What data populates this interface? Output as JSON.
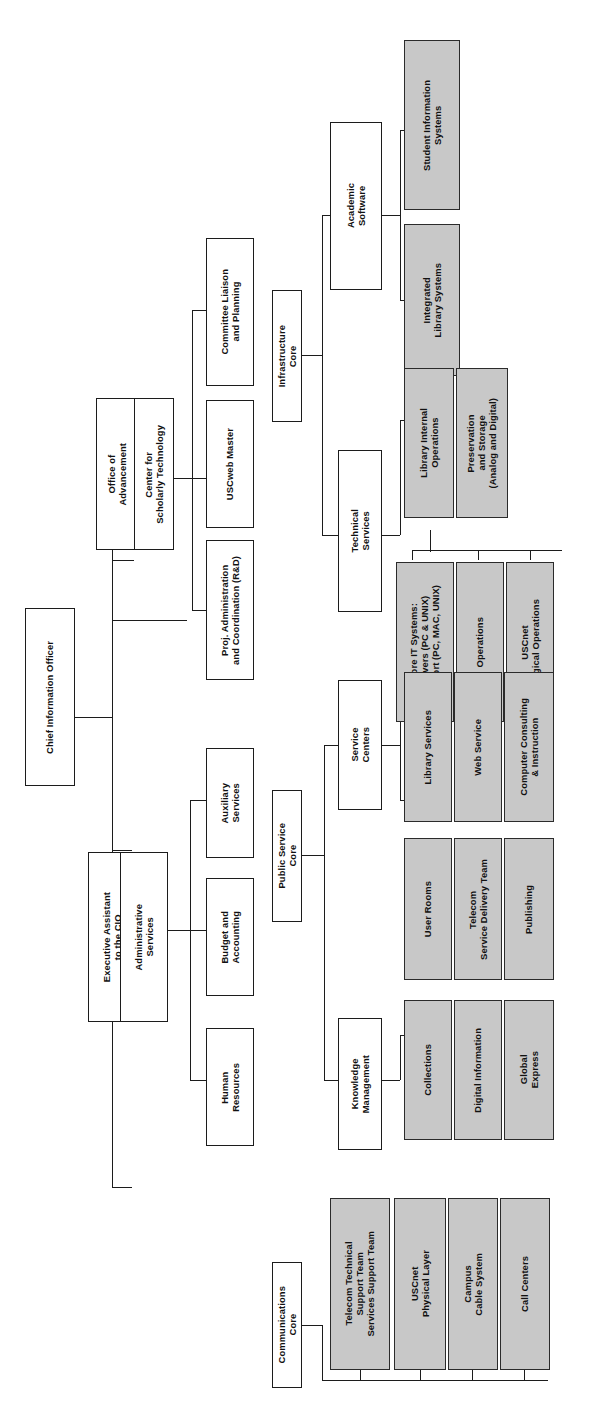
{
  "diagram": {
    "type": "organizational-chart",
    "orientation": "rotated-90-left",
    "legend": {
      "plain_box": "administrative / core unit",
      "shaded_box": "operational service team"
    },
    "colors": {
      "box_fill": "#ffffff",
      "shaded_fill": "#c8c8c8",
      "border": "#1c1c1c",
      "text": "#111111",
      "background": "#ffffff"
    }
  },
  "nodes": {
    "cio": "Chief Information Officer",
    "exec_assistant": "Executive Assistant\nto the CIO",
    "admin_services": "Administrative\nServices",
    "human_resources": "Human\nResources",
    "budget_accounting": "Budget and\nAccounting",
    "auxiliary_services": "Auxiliary\nServices",
    "office_advancement": "Office of\nAdvancement",
    "center_scholarly_tech": "Center for\nScholarly Technology",
    "proj_administration": "Proj. Administration\nand Coordination (R&D)",
    "uscweb_master": "USCweb Master",
    "committee_liaison": "Committee Liaison\nand Planning",
    "infrastructure_core": "Infrastructure\nCore",
    "academic_software": "Academic\nSoftware",
    "student_info_systems": "Student Information\nSystems",
    "integrated_library_systems": "Integrated\nLibrary Systems",
    "technical_services": "Technical\nServices",
    "library_internal_ops": "Library Internal\nOperations",
    "preservation_storage": "Preservation\nand Storage\n(Analog and Digital)",
    "core_it_systems": "Core IT Systems:\nServers (PC & UNIX)\nSupport (PC, MAC, UNIX)",
    "operations": "Operations",
    "uscnet_logical_ops": "USCnet\nLogical Operations",
    "public_service_core": "Public Service\nCore",
    "service_centers": "Service\nCenters",
    "library_services": "Library Services",
    "web_service": "Web Service",
    "computer_consulting": "Computer Consulting\n& Instruction",
    "user_rooms": "User Rooms",
    "telecom_service_delivery": "Telecom\nService Delivery Team",
    "publishing": "Publishing",
    "knowledge_management": "Knowledge\nManagement",
    "collections": "Collections",
    "digital_information": "Digital Information",
    "global_express": "Global\nExpress",
    "communications_core": "Communications\nCore",
    "telecom_technical_support": "Telecom Technical\nSupport Team\nServices Support Team",
    "uscnet_physical_layer": "USCnet\nPhysical Layer",
    "campus_cable_system": "Campus\nCable System",
    "call_centers": "Call Centers"
  }
}
